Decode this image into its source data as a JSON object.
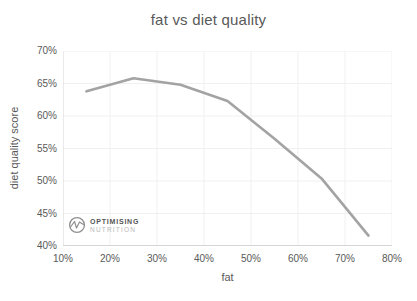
{
  "title": "fat vs diet quality",
  "watermark": {
    "line1": "OPTIMISING",
    "line2": "NUTRITION",
    "icon": "pulse-wave-in-circle"
  },
  "colors": {
    "background": "#ffffff",
    "title_text": "#595959",
    "tick_text": "#595959",
    "gridline": "#f0f0f0",
    "axis_line": "#d6d6d6",
    "series_line": "#a3a3a3",
    "watermark_primary": "#555555",
    "watermark_secondary": "#b8b8b8",
    "watermark_icon": "#8f8f8f"
  },
  "chart_data": {
    "type": "line",
    "title": "fat vs diet quality",
    "xlabel": "fat",
    "ylabel": "diet quality score",
    "x": [
      15,
      25,
      35,
      45,
      55,
      65,
      75
    ],
    "series": [
      {
        "name": "diet quality score",
        "values": [
          63.8,
          65.8,
          64.8,
          62.3,
          56.5,
          50.4,
          41.6
        ],
        "color": "#a3a3a3",
        "width": 2.6
      }
    ],
    "xlim": [
      10,
      80
    ],
    "ylim": [
      40,
      70
    ],
    "x_tick_values": [
      10,
      20,
      30,
      40,
      50,
      60,
      70,
      80
    ],
    "x_tick_labels": [
      "10%",
      "20%",
      "30%",
      "40%",
      "50%",
      "60%",
      "70%",
      "80%"
    ],
    "y_tick_values": [
      40,
      45,
      50,
      55,
      60,
      65,
      70
    ],
    "y_tick_labels": [
      "40%",
      "45%",
      "50%",
      "55%",
      "60%",
      "65%",
      "70%"
    ],
    "grid": true,
    "legend": "none"
  }
}
